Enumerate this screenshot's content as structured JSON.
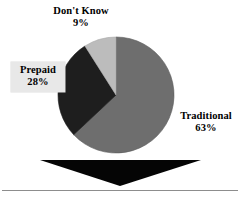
{
  "background_color": "#ffffff",
  "chart_data": {
    "type": "pie",
    "title": "",
    "subtitle": "",
    "xlabel": "",
    "ylabel": "",
    "legend_position": "none",
    "grid": false,
    "categories": [
      "Traditional",
      "Prepaid",
      "Don't Know"
    ],
    "values": [
      63,
      28,
      9
    ],
    "value_suffix": "%",
    "start_angle_deg": 0,
    "direction": "clockwise",
    "slices": [
      {
        "name": "Traditional",
        "label": "Traditional",
        "value": 63,
        "value_text": "63%",
        "color": "#6e6e6e",
        "start_deg": 0,
        "end_deg": 226.8
      },
      {
        "name": "Prepaid",
        "label": "Prepaid",
        "value": 28,
        "value_text": "28%",
        "color": "#1e1e1e",
        "start_deg": 226.8,
        "end_deg": 327.6
      },
      {
        "name": "DontKnow",
        "label": "Don't Know",
        "value": 9,
        "value_text": "9%",
        "color": "#bcbcbc",
        "start_deg": 327.6,
        "end_deg": 360
      }
    ],
    "outline_color": "#555555",
    "center": {
      "x": 116,
      "y": 95
    },
    "radius": 58
  },
  "labels": {
    "dontknow": {
      "name": "Don't Know",
      "percent": "9%"
    },
    "prepaid": {
      "name": "Prepaid",
      "percent": "28%",
      "box_color": "#e8e8e8"
    },
    "traditional": {
      "name": "Traditional",
      "percent": "63%"
    }
  },
  "decorations": {
    "arrow": {
      "name": "down-arrow",
      "color": "#000000",
      "direction": "down"
    },
    "rule": {
      "name": "horizontal-rule",
      "color": "#8d8d8d"
    }
  }
}
